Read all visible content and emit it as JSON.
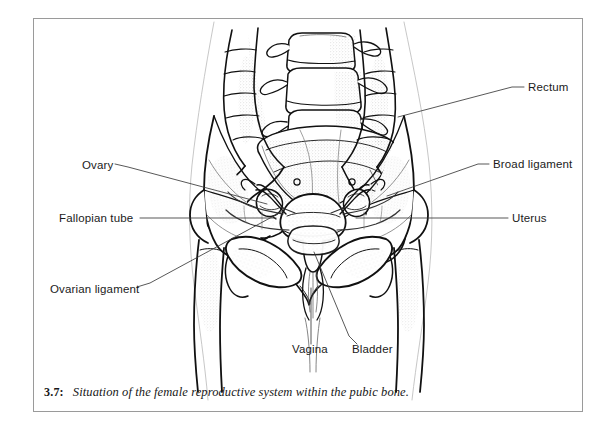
{
  "figure": {
    "number": "3.7:",
    "caption": "Situation of the female reproductive system within the pubic bone.",
    "title": "Situation of the female reproductive system within the pubic bone.",
    "type": "anatomical-line-illustration",
    "ink_color": "#111111",
    "background_color": "#ffffff",
    "frame_color": "#9a9a9a"
  },
  "labels": [
    {
      "id": "rectum",
      "text": "Rectum",
      "side": "right",
      "x": 528,
      "y": 88,
      "anchor_x": 400,
      "anchor_y": 117
    },
    {
      "id": "broad-ligament",
      "text": "Broad ligament",
      "side": "right",
      "x": 493,
      "y": 165,
      "anchor_x": 388,
      "anchor_y": 196
    },
    {
      "id": "uterus",
      "text": "Uterus",
      "side": "right",
      "x": 512,
      "y": 219,
      "anchor_x": 356,
      "anchor_y": 219
    },
    {
      "id": "ovary",
      "text": "Ovary",
      "side": "left",
      "x": 82,
      "y": 166,
      "anchor_x": 268,
      "anchor_y": 204
    },
    {
      "id": "fallopian-tube",
      "text": "Fallopian tube",
      "side": "left",
      "x": 59,
      "y": 219,
      "anchor_x": 276,
      "anchor_y": 219
    },
    {
      "id": "ovarian-ligament",
      "text": "Ovarian ligament",
      "side": "left",
      "x": 50,
      "y": 290,
      "anchor_x": 281,
      "anchor_y": 210
    },
    {
      "id": "vagina",
      "text": "Vagina",
      "side": "bottom",
      "x": 292,
      "y": 350,
      "anchor_x": 309,
      "anchor_y": 288
    },
    {
      "id": "bladder",
      "text": "Bladder",
      "side": "bottom",
      "x": 352,
      "y": 350,
      "anchor_x": 313,
      "anchor_y": 253
    }
  ],
  "structures": [
    "lumbar vertebrae",
    "sacrum",
    "ilium",
    "pubic bone",
    "femur head",
    "large intestine",
    "rectum",
    "uterus",
    "ovary",
    "fallopian tube",
    "broad ligament",
    "ovarian ligament",
    "bladder",
    "vagina",
    "body outline"
  ]
}
